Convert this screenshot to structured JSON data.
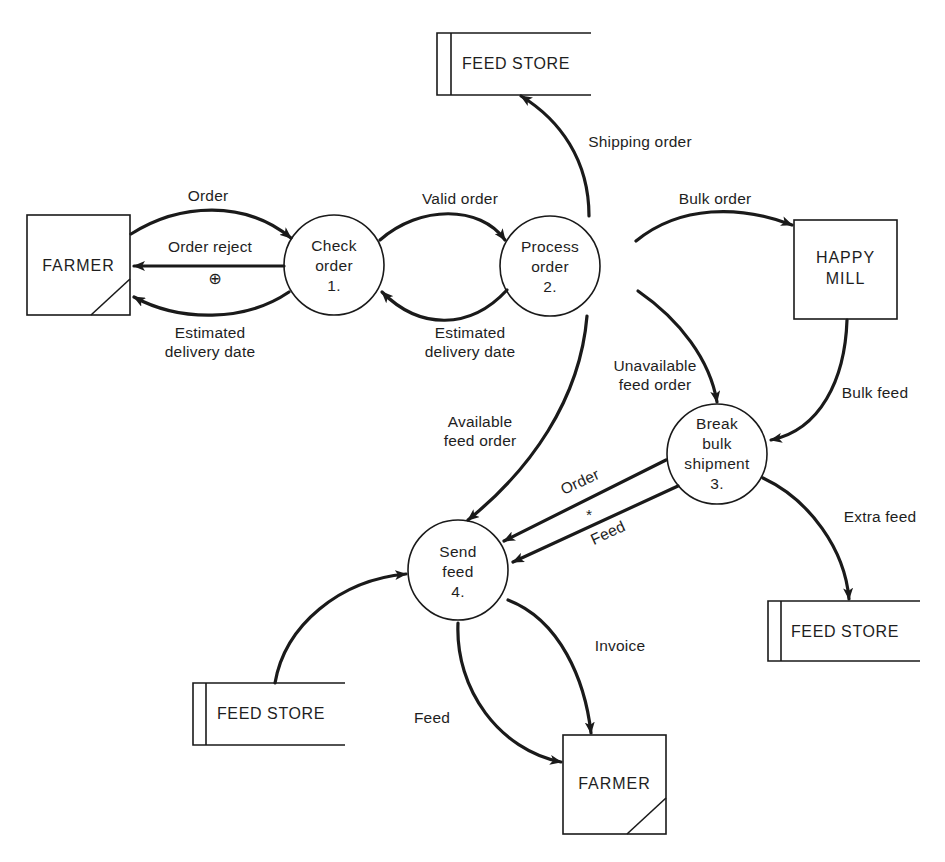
{
  "diagram": {
    "type": "data-flow-diagram",
    "colors": {
      "ink": "#1a1a1a",
      "background": "#ffffff"
    },
    "processes": [
      {
        "id": 1,
        "lines": [
          "Check",
          "order",
          "1."
        ]
      },
      {
        "id": 2,
        "lines": [
          "Process",
          "order",
          "2."
        ]
      },
      {
        "id": 3,
        "lines": [
          "Break",
          "bulk",
          "shipment",
          "3."
        ]
      },
      {
        "id": 4,
        "lines": [
          "Send",
          "feed",
          "4."
        ]
      }
    ],
    "entities": [
      {
        "id": "farmer-top",
        "lines": [
          "FARMER"
        ],
        "duplicate_marker": true
      },
      {
        "id": "happy-mill",
        "lines": [
          "HAPPY",
          "MILL"
        ],
        "duplicate_marker": false
      },
      {
        "id": "farmer-bottom",
        "lines": [
          "FARMER"
        ],
        "duplicate_marker": true
      }
    ],
    "stores": [
      {
        "id": "store-top",
        "label": "FEED STORE"
      },
      {
        "id": "store-right",
        "label": "FEED STORE"
      },
      {
        "id": "store-bottom-left",
        "label": "FEED STORE"
      }
    ],
    "flows": [
      {
        "from": "FARMER",
        "to": "Check order",
        "label": "Order"
      },
      {
        "from": "Check order",
        "to": "FARMER",
        "label": "Order reject"
      },
      {
        "from": "Check order",
        "to": "FARMER",
        "label": "Estimated delivery date"
      },
      {
        "from": "Check order",
        "to": "Process order",
        "label": "Valid order"
      },
      {
        "from": "Process order",
        "to": "Check order",
        "label": "Estimated delivery date"
      },
      {
        "from": "Process order",
        "to": "FEED STORE",
        "label": "Shipping order"
      },
      {
        "from": "Process order",
        "to": "HAPPY MILL",
        "label": "Bulk order"
      },
      {
        "from": "Process order",
        "to": "Break bulk shipment",
        "label": "Unavailable feed order"
      },
      {
        "from": "HAPPY MILL",
        "to": "Break bulk shipment",
        "label": "Bulk feed"
      },
      {
        "from": "Process order",
        "to": "Send feed",
        "label": "Available feed order"
      },
      {
        "from": "Break bulk shipment",
        "to": "Send feed",
        "label": "Order"
      },
      {
        "from": "Break bulk shipment",
        "to": "Send feed",
        "label": "Feed"
      },
      {
        "from": "Break bulk shipment",
        "to": "FEED STORE",
        "label": "Extra feed"
      },
      {
        "from": "FEED STORE",
        "to": "Send feed",
        "label": ""
      },
      {
        "from": "Send feed",
        "to": "FARMER",
        "label": "Invoice"
      },
      {
        "from": "Send feed",
        "to": "FARMER",
        "label": "Feed"
      }
    ],
    "symbols": {
      "exclusive_or": "⊕",
      "and": "*"
    },
    "labels": {
      "order": "Order",
      "order_reject": "Order reject",
      "est_delivery_1": [
        "Estimated",
        "delivery date"
      ],
      "valid_order": "Valid order",
      "est_delivery_2": [
        "Estimated",
        "delivery date"
      ],
      "shipping_order": "Shipping order",
      "bulk_order": "Bulk order",
      "unavailable_feed_order": [
        "Unavailable",
        "feed order"
      ],
      "bulk_feed": "Bulk feed",
      "available_feed_order": [
        "Available",
        "feed order"
      ],
      "order_to_send": "Order",
      "feed_to_send": "Feed",
      "extra_feed": "Extra feed",
      "invoice": "Invoice",
      "feed_to_farmer": "Feed"
    }
  }
}
